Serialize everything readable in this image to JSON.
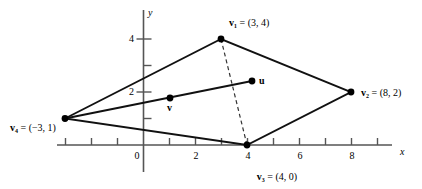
{
  "figure": {
    "type": "coordinate-plane-diagram",
    "title": "",
    "background_color": "#ffffff",
    "line_color": "#000000",
    "axis_color": "#555555"
  },
  "axes": {
    "x_axis_label": "x",
    "y_axis_label": "y",
    "origin_label": "0",
    "x_tick_labels": [
      "0",
      "2",
      "4",
      "6",
      "8"
    ],
    "x_tick_values": [
      0,
      2,
      4,
      6,
      8
    ],
    "x_ticks_all": [
      -3,
      -2,
      -1,
      0,
      1,
      2,
      3,
      4,
      5,
      6,
      7,
      8,
      9
    ],
    "y_tick_labels": [
      "2",
      "4"
    ],
    "y_tick_values": [
      2,
      4
    ],
    "y_ticks_all": [
      1,
      2,
      3,
      4
    ],
    "x_range": [
      -3.3,
      9.6
    ],
    "y_range": [
      -0.95,
      5.1
    ]
  },
  "points": [
    {
      "id": "v1",
      "label": "v",
      "subscript": "1",
      "coord_text": "= (3, 4)",
      "x": 3,
      "y": 4,
      "dot": true
    },
    {
      "id": "v2",
      "label": "v",
      "subscript": "2",
      "coord_text": "= (8, 2)",
      "x": 8,
      "y": 2,
      "dot": true
    },
    {
      "id": "v3",
      "label": "v",
      "subscript": "3",
      "coord_text": "= (4, 0)",
      "x": 4,
      "y": 0,
      "dot": true
    },
    {
      "id": "v4",
      "label": "v",
      "subscript": "4",
      "coord_text": "= (−3, 1)",
      "x": -3,
      "y": 1,
      "dot": true
    },
    {
      "id": "u",
      "label": "u",
      "subscript": "",
      "coord_text": "",
      "x": 4.2,
      "y": 2.42,
      "dot": true
    },
    {
      "id": "v",
      "label": "v",
      "subscript": "",
      "coord_text": "",
      "x": 1.04,
      "y": 1.77,
      "dot": true
    }
  ],
  "labels": {
    "v1": "v₁ = (3, 4)",
    "v2": "v₂ = (8, 2)",
    "v3": "v₃ = (4, 0)",
    "v4": "v₄ = (−3, 1)",
    "u": "u",
    "v": "v"
  },
  "chart_data": {
    "type": "scatter",
    "title": "",
    "xlabel": "x",
    "ylabel": "y",
    "xlim": [
      -3.3,
      9.6
    ],
    "ylim": [
      -0.95,
      5.1
    ],
    "grid": false,
    "legend": "none",
    "vertices": [
      {
        "name": "v1",
        "x": 3,
        "y": 4
      },
      {
        "name": "v2",
        "x": 8,
        "y": 2
      },
      {
        "name": "v3",
        "x": 4,
        "y": 0
      },
      {
        "name": "v4",
        "x": -3,
        "y": 1
      }
    ],
    "interior_points": [
      {
        "name": "u",
        "x": 4.2,
        "y": 2.42
      },
      {
        "name": "v",
        "x": 1.04,
        "y": 1.77
      }
    ],
    "solid_segments": [
      {
        "from": "v4",
        "to": "v1"
      },
      {
        "from": "v1",
        "to": "v2"
      },
      {
        "from": "v2",
        "to": "v3"
      },
      {
        "from": "v3",
        "to": "v4"
      },
      {
        "from": "v4",
        "to": "u"
      }
    ],
    "dashed_segments": [
      {
        "from": "v1",
        "to": "v3"
      }
    ]
  }
}
